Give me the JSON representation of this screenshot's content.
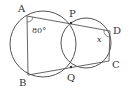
{
  "colors": {
    "stroke": "#555555",
    "text": "#333333",
    "background": "#ffffff"
  },
  "labels": {
    "A": "A",
    "P": "P",
    "D": "D",
    "B": "B",
    "Q": "Q",
    "C": "C"
  },
  "angles": {
    "angle_A": "80°",
    "angle_D": "x"
  },
  "geometry": {
    "left_circle": {
      "cx": 43,
      "cy": 44,
      "r": 33
    },
    "right_circle": {
      "cx": 86,
      "cy": 43,
      "r": 25
    },
    "points": {
      "A": [
        27,
        16
      ],
      "P": [
        71,
        23
      ],
      "D": [
        110,
        31
      ],
      "B": [
        28,
        75
      ],
      "Q": [
        71,
        67
      ],
      "C": [
        109,
        61
      ]
    }
  }
}
